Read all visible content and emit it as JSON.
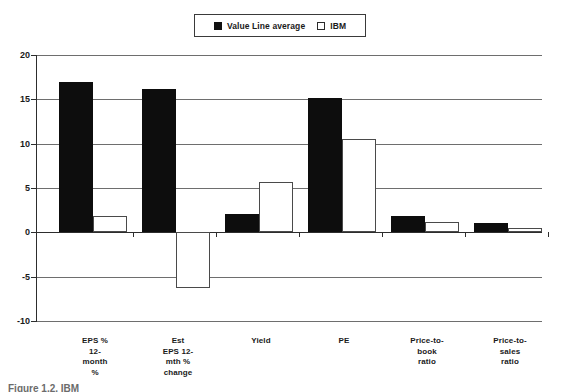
{
  "legend": {
    "entries": [
      {
        "label": "Value Line average",
        "swatch": "filled-square-icon",
        "color": "#0d0d0d"
      },
      {
        "label": "IBM",
        "swatch": "open-square-icon",
        "color": "#ffffff"
      }
    ]
  },
  "axis": {
    "y_ticks": [
      "20",
      "15",
      "10",
      "5",
      "0",
      "-5",
      "-10"
    ]
  },
  "caption": {
    "text": "Figure 1.2. IBM"
  },
  "chart_data": {
    "type": "bar",
    "title": "",
    "subtitle": "",
    "xlabel": "",
    "ylabel": "",
    "ylim": [
      -10,
      20
    ],
    "ytick_values": [
      20,
      15,
      10,
      5,
      0,
      -5,
      -10
    ],
    "grid": true,
    "legend_position": "top-center",
    "categories": [
      "EPS %\n12-\nmonth\n%",
      "Est\nEPS 12-\nmth %\nchange",
      "Yield",
      "PE",
      "Price-to-\nbook\nratio",
      "Price-to-\nsales\nratio"
    ],
    "series": [
      {
        "name": "Value Line average",
        "color": "#0d0d0d",
        "values": [
          17.0,
          16.2,
          2.1,
          15.1,
          1.8,
          1.0
        ]
      },
      {
        "name": "IBM",
        "color": "#ffffff",
        "values": [
          1.8,
          -6.3,
          5.7,
          10.5,
          1.2,
          0.5
        ]
      }
    ]
  }
}
